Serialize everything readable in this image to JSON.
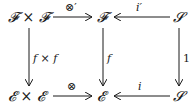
{
  "diagram": {
    "type": "commutative-diagram",
    "nodes": {
      "top_left": "𝓕 × 𝓕",
      "top_mid": "𝓕",
      "top_right": "𝓢",
      "bottom_left": "𝓔 × 𝓔",
      "bottom_mid": "𝓔",
      "bottom_right": "𝓢"
    },
    "arrows": {
      "top_left_to_mid": "⊗′",
      "top_right_to_mid": "i′",
      "left_down": "f × f",
      "mid_down": "f",
      "right_down": "1",
      "bottom_left_to_mid": "⊗",
      "bottom_right_to_mid": "i"
    }
  }
}
